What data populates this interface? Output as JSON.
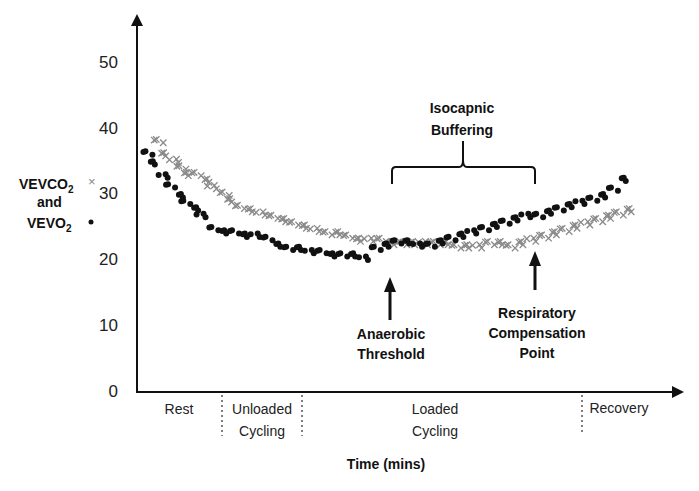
{
  "chart_data": {
    "type": "scatter",
    "title": "",
    "xlabel": "Time (mins)",
    "ylabel": "VEVCO2 and VEVO2",
    "ylim": [
      0,
      55
    ],
    "yticks": [
      0,
      10,
      20,
      30,
      40,
      50
    ],
    "grid": false,
    "legend": [
      {
        "name": "VEVCO2",
        "marker": "x",
        "color": "#8a8a8a"
      },
      {
        "name": "VEVO2",
        "marker": "dot",
        "color": "#000000"
      }
    ],
    "phases": [
      {
        "label": "Rest",
        "line2": ""
      },
      {
        "label": "Unloaded",
        "line2": "Cycling"
      },
      {
        "label": "Loaded",
        "line2": "Cycling"
      },
      {
        "label": "Recovery",
        "line2": ""
      }
    ],
    "annotations": [
      {
        "text": "Isocapnic",
        "text2": "Buffering",
        "type": "brace"
      },
      {
        "text": "Anaerobic",
        "text2": "Threshold",
        "type": "arrow"
      },
      {
        "text": "Respiratory",
        "text2": "Compensation",
        "text3": "Point",
        "type": "arrow"
      }
    ],
    "series": [
      {
        "name": "VEVCO2",
        "marker": "x",
        "x": [
          0.03,
          0.04,
          0.06,
          0.07,
          0.08,
          0.1,
          0.12,
          0.13,
          0.15,
          0.16,
          0.18,
          0.2,
          0.22,
          0.24,
          0.26,
          0.28,
          0.3,
          0.32,
          0.34,
          0.36,
          0.38,
          0.4,
          0.42,
          0.44,
          0.46,
          0.48,
          0.5,
          0.52,
          0.54,
          0.56,
          0.58,
          0.6,
          0.62,
          0.64,
          0.66,
          0.68,
          0.7,
          0.72,
          0.74,
          0.76,
          0.78,
          0.8,
          0.82,
          0.84,
          0.86,
          0.88,
          0.9
        ],
        "y": [
          38,
          36,
          35,
          34,
          33,
          33,
          32,
          31,
          30,
          29,
          28,
          27.5,
          27,
          26.5,
          26,
          25.5,
          25,
          24.5,
          24,
          24,
          23.5,
          23,
          23,
          23,
          22.5,
          22.5,
          22.5,
          22.5,
          22.5,
          22.5,
          22,
          22,
          22,
          22.5,
          22.5,
          22,
          22.5,
          23,
          23.5,
          24,
          24.5,
          25,
          25.5,
          26,
          26.5,
          27,
          27.5
        ]
      },
      {
        "name": "VEVO2",
        "marker": "dot",
        "x": [
          0.01,
          0.02,
          0.04,
          0.05,
          0.07,
          0.08,
          0.1,
          0.11,
          0.13,
          0.15,
          0.17,
          0.19,
          0.21,
          0.23,
          0.25,
          0.27,
          0.29,
          0.31,
          0.33,
          0.35,
          0.37,
          0.39,
          0.41,
          0.43,
          0.45,
          0.47,
          0.49,
          0.51,
          0.53,
          0.55,
          0.57,
          0.59,
          0.61,
          0.63,
          0.65,
          0.67,
          0.69,
          0.71,
          0.73,
          0.75,
          0.77,
          0.79,
          0.81,
          0.83,
          0.85,
          0.87,
          0.89
        ],
        "y": [
          36.5,
          35,
          33,
          31.5,
          30,
          29,
          28,
          27,
          25,
          24.5,
          24.5,
          24,
          24,
          23.5,
          22.5,
          22,
          22,
          21.5,
          21.5,
          21,
          21,
          21,
          20.5,
          22,
          22.5,
          23,
          23,
          22.5,
          22.5,
          23,
          23.5,
          24,
          24.5,
          25,
          25.5,
          26,
          26.5,
          27,
          27,
          27.5,
          28,
          28.5,
          29,
          29.5,
          30,
          31,
          32.5
        ]
      }
    ]
  }
}
